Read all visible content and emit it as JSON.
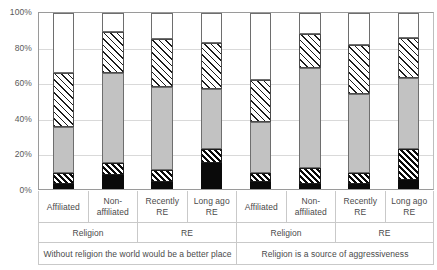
{
  "chart_data": {
    "type": "bar",
    "subtype": "stacked-100-percent",
    "title": "",
    "xlabel": "",
    "ylabel": "",
    "ylim": [
      0,
      100
    ],
    "ytick_labels": [
      "0%",
      "20%",
      "40%",
      "60%",
      "80%",
      "100%"
    ],
    "ytick_values": [
      0,
      20,
      40,
      60,
      80,
      100
    ],
    "grid": true,
    "legend_position": "none",
    "orientation": "vertical",
    "categories": [
      "Affiliated",
      "Non-affiliated",
      "Recently RE",
      "Long ago RE",
      "Affiliated",
      "Non-affiliated",
      "Recently RE",
      "Long ago RE"
    ],
    "series": [
      {
        "name": "segment-1",
        "pattern": "solid-black",
        "color": "#0a0a0a",
        "values": [
          3,
          8,
          4,
          15,
          4,
          3,
          3,
          5
        ]
      },
      {
        "name": "segment-2",
        "pattern": "diagonal-hatch-dark",
        "color": "#ffffff",
        "values": [
          6,
          7,
          7,
          8,
          5,
          9,
          6,
          18
        ]
      },
      {
        "name": "segment-3",
        "pattern": "solid-gray",
        "color": "#c2c2c2",
        "values": [
          26,
          51,
          47,
          34,
          29,
          57,
          45,
          40
        ]
      },
      {
        "name": "segment-4",
        "pattern": "diagonal-hatch-light",
        "color": "#ffffff",
        "values": [
          31,
          23,
          27,
          26,
          24,
          19,
          28,
          23
        ]
      },
      {
        "name": "segment-5",
        "pattern": "solid-white",
        "color": "#ffffff",
        "values": [
          34,
          11,
          15,
          17,
          38,
          12,
          18,
          14
        ]
      }
    ],
    "cumulative_tops": [
      [
        3,
        9,
        35,
        66,
        100
      ],
      [
        8,
        15,
        66,
        89,
        100
      ],
      [
        4,
        11,
        58,
        85,
        100
      ],
      [
        15,
        23,
        57,
        83,
        100
      ],
      [
        4,
        9,
        38,
        62,
        100
      ],
      [
        3,
        12,
        69,
        88,
        100
      ],
      [
        3,
        9,
        54,
        82,
        100
      ],
      [
        5,
        23,
        63,
        86,
        100
      ]
    ]
  },
  "axis": {
    "category_row": [
      {
        "line1": "Affiliated",
        "line2": ""
      },
      {
        "line1": "Non-",
        "line2": "affiliated"
      },
      {
        "line1": "Recently",
        "line2": "RE"
      },
      {
        "line1": "Long ago",
        "line2": "RE"
      },
      {
        "line1": "Affiliated",
        "line2": ""
      },
      {
        "line1": "Non-",
        "line2": "affiliated"
      },
      {
        "line1": "Recently",
        "line2": "RE"
      },
      {
        "line1": "Long ago",
        "line2": "RE"
      }
    ],
    "group_row": [
      {
        "label": "Religion",
        "span": 2
      },
      {
        "label": "RE",
        "span": 2
      },
      {
        "label": "Religion",
        "span": 2
      },
      {
        "label": "RE",
        "span": 2
      }
    ],
    "question_row": [
      {
        "label": "Without religion the world would be a better place",
        "span": 4
      },
      {
        "label": "Religion is a source of aggressiveness",
        "span": 4
      }
    ]
  },
  "colors": {
    "segment_black": "#0a0a0a",
    "segment_gray": "#c2c2c2",
    "segment_white": "#ffffff",
    "hatch_stroke": "#1c1c1c",
    "gridline": "#d9d9d9",
    "axis_line": "#9a9a9a",
    "text": "#4a4a4a"
  }
}
